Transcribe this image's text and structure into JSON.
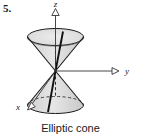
{
  "figure": {
    "problem_number": "5.",
    "caption": "Elliptic cone",
    "axes": {
      "z_label": "z",
      "y_label": "y",
      "x_label": "x"
    },
    "colors": {
      "stroke": "#1a1a1a",
      "surface_fill": "#d9d9d9",
      "surface_fill_light": "#e8e8e8",
      "background": "#ffffff"
    },
    "shape": {
      "name": "elliptic-cone",
      "nappes": 2,
      "vertex": "origin"
    }
  }
}
